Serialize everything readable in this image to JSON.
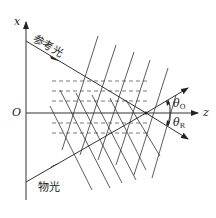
{
  "diagram": {
    "axes": {
      "vertical_label": "x",
      "horizontal_label": "z",
      "origin_label": "O"
    },
    "beams": {
      "reference": {
        "label": "参考光",
        "theta_label": "θ",
        "theta_sub": "R"
      },
      "object": {
        "label": "物光",
        "theta_label": "θ",
        "theta_sub": "O"
      }
    },
    "colors": {
      "line": "#333333",
      "dashed": "#555555",
      "background": "#ffffff"
    }
  }
}
